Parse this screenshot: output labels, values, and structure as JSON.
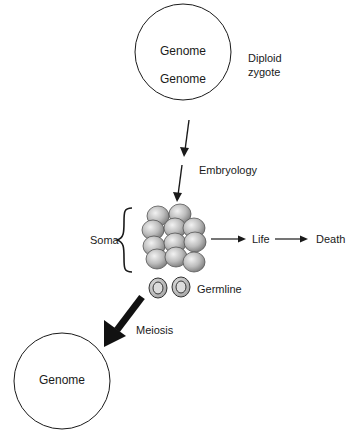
{
  "diagram": {
    "zygote": {
      "genome_top": "Genome",
      "genome_bottom": "Genome",
      "label_line1": "Diploid",
      "label_line2": "zygote"
    },
    "embryology_label": "Embryology",
    "soma_label": "Soma",
    "life_label": "Life",
    "death_label": "Death",
    "germline_label": "Germline",
    "meiosis_label": "Meiosis",
    "gamete": {
      "genome": "Genome"
    },
    "colors": {
      "line": "#1a1a1a",
      "cell_light": "#e6e6e6",
      "cell_dark": "#8a8a8a"
    }
  }
}
